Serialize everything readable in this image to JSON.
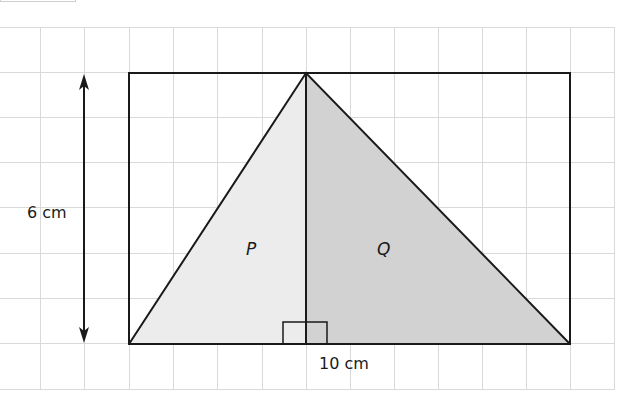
{
  "figure": {
    "type": "geometry-diagram",
    "labels": {
      "height": "6 cm",
      "width": "10 cm",
      "region_left": "P",
      "region_right": "Q"
    },
    "colors": {
      "grid": "#d9d9d9",
      "outline": "#1a1a1a",
      "region_p_fill": "#ececec",
      "region_q_fill": "#d2d2d2"
    },
    "grid": {
      "cell_size_px": 45,
      "x_start": 0,
      "x_end": 615,
      "y_start": 27,
      "y_end": 389
    },
    "rectangle": {
      "x": 129,
      "y": 73,
      "width": 441,
      "height": 271
    },
    "triangle_apex": {
      "x": 306,
      "y": 73
    },
    "right_angle_marker": {
      "x": 283,
      "y": 322,
      "width": 44,
      "height": 22
    },
    "height_arrow": {
      "x": 84,
      "y1": 74,
      "y2": 343
    }
  }
}
